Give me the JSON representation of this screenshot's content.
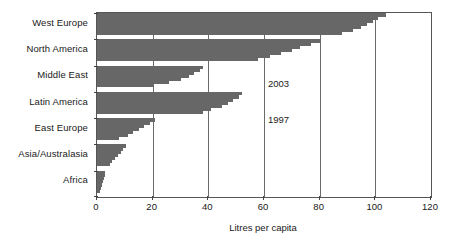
{
  "chart_data": {
    "type": "bar",
    "title": "",
    "subtitle": "",
    "xlabel": "Litres per capita",
    "ylabel": "",
    "xlim": [
      0,
      120
    ],
    "xticks": [
      0,
      20,
      40,
      60,
      80,
      100,
      120
    ],
    "xtick_labels": [
      "0",
      "20",
      "40",
      "60",
      "80",
      "100",
      "120"
    ],
    "grid": true,
    "legend_position": "in-plot-annotation",
    "orientation": "horizontal",
    "annotations": [
      {
        "text": "2003",
        "note": "top sub-bar of each band is year 2003"
      },
      {
        "text": "1997",
        "note": "bottom sub-bar of each band is year 1997"
      }
    ],
    "categories": [
      "West Europe",
      "North America",
      "Middle East",
      "Latin America",
      "East Europe",
      "Asia/Australasia",
      "Africa"
    ],
    "series": [
      {
        "name": "1997",
        "values": [
          88,
          58,
          20,
          38,
          8,
          4.5,
          1.2
        ]
      },
      {
        "name": "1998",
        "values": [
          92,
          62,
          26,
          41,
          11,
          5.5,
          1.5
        ]
      },
      {
        "name": "1999",
        "values": [
          95,
          66,
          30,
          45,
          13,
          6.5,
          1.8
        ]
      },
      {
        "name": "2000",
        "values": [
          97,
          70,
          33,
          47,
          15,
          7.5,
          2.1
        ]
      },
      {
        "name": "2001",
        "values": [
          99,
          73,
          35,
          49,
          17,
          8.5,
          2.4
        ]
      },
      {
        "name": "2002",
        "values": [
          101,
          77,
          37,
          51,
          19,
          9.5,
          2.7
        ]
      },
      {
        "name": "2003",
        "values": [
          104,
          80,
          38,
          52,
          21,
          10.5,
          3.0
        ]
      }
    ],
    "bar_color": "#676767",
    "axis_color": "#555555"
  },
  "axis": {
    "x_title": "Litres per capita"
  },
  "annotations": {
    "year_top": "2003",
    "year_bottom": "1997"
  },
  "colors": {
    "bar": "#676767",
    "axis": "#555555",
    "grid": "#6a6a6a",
    "background": "#ffffff",
    "text": "#1a1a1a"
  }
}
